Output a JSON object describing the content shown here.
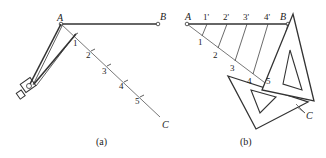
{
  "panels": [
    {
      "caption": "(a)",
      "points": {
        "A": "A",
        "B": "B",
        "C": "C"
      },
      "divisions": [
        "1",
        "2",
        "3",
        "4",
        "5"
      ],
      "tool": "compass-icon"
    },
    {
      "caption": "(b)",
      "points": {
        "A": "A",
        "B": "B",
        "C": "C"
      },
      "divisions": [
        "1",
        "2",
        "3",
        "4",
        "5"
      ],
      "primed_divisions": [
        "1'",
        "2'",
        "3'",
        "4'"
      ],
      "tool": "set-squares-icon"
    }
  ],
  "colors": {
    "line": "#333333",
    "light_line": "#555555",
    "background": "#ffffff"
  }
}
